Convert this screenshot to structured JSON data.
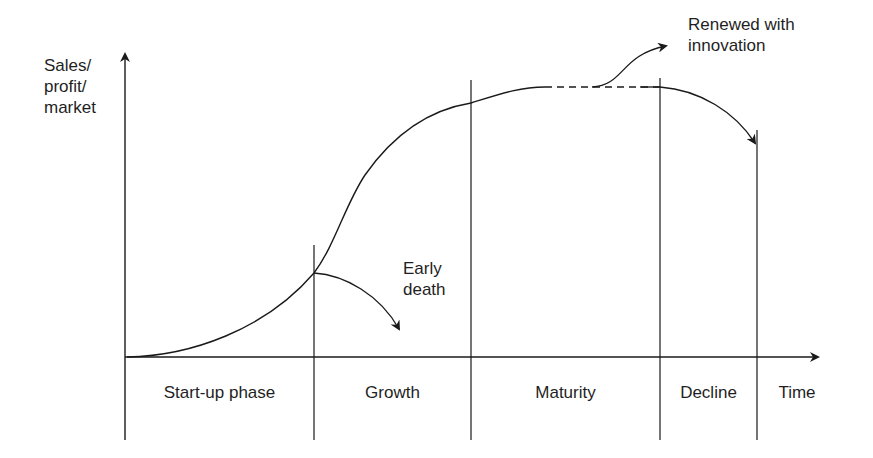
{
  "diagram": {
    "y_axis_label": "Sales/\nprofit/\nmarket",
    "x_axis_label": "Time",
    "phases": [
      {
        "label": "Start-up phase"
      },
      {
        "label": "Growth"
      },
      {
        "label": "Maturity"
      },
      {
        "label": "Decline"
      }
    ],
    "annotations": {
      "early_death": "Early\ndeath",
      "renewed": "Renewed with\ninnovation"
    },
    "colors": {
      "stroke": "#1a1a1a",
      "background": "#ffffff"
    }
  }
}
